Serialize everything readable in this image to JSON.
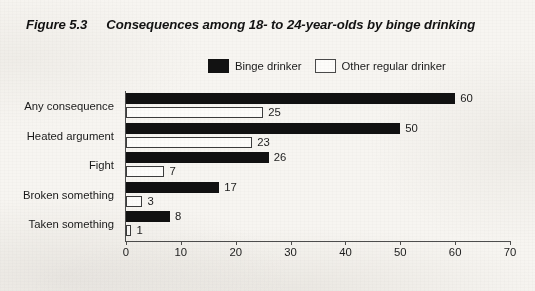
{
  "figure": {
    "number": "Figure 5.3",
    "title": "Consequences among 18- to 24-year-olds by binge drinking"
  },
  "legend": {
    "position": "top-center",
    "items": [
      {
        "label": "Binge drinker",
        "swatch": "filled-black-square",
        "color": "#111111"
      },
      {
        "label": "Other regular drinker",
        "swatch": "hollow-white-square",
        "color": "#fdfcfa"
      }
    ]
  },
  "chart_data": {
    "type": "bar",
    "orientation": "horizontal",
    "title": "Consequences among 18- to 24-year-olds by binge drinking",
    "xlabel": "",
    "ylabel": "",
    "xlim": [
      0,
      70
    ],
    "xticks": [
      0,
      10,
      20,
      30,
      40,
      50,
      60,
      70
    ],
    "grid": false,
    "legend_position": "top-center",
    "categories": [
      "Any consequence",
      "Heated argument",
      "Fight",
      "Broken something",
      "Taken something"
    ],
    "series": [
      {
        "name": "Binge drinker",
        "color": "#111111",
        "values": [
          60,
          50,
          26,
          17,
          8
        ]
      },
      {
        "name": "Other regular drinker",
        "color": "#fdfcfa",
        "values": [
          25,
          23,
          7,
          3,
          1
        ]
      }
    ],
    "data_labels": {
      "Binge drinker": [
        "60",
        "50",
        "26",
        "17",
        "8"
      ],
      "Other regular drinker": [
        "25",
        "23",
        "7",
        "3",
        "1"
      ]
    }
  }
}
